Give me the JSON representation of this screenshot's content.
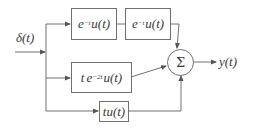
{
  "diagram": {
    "type": "block-diagram",
    "input": {
      "label": "δ(t)"
    },
    "output": {
      "label": "y(t)"
    },
    "blocks": [
      {
        "id": "h1",
        "base": "e",
        "exponent": "−t",
        "suffix": "u(t)"
      },
      {
        "id": "h2",
        "base": "e",
        "exponent": "−t",
        "suffix": "u(t)"
      },
      {
        "id": "h3",
        "prefix": "t",
        "base": "e",
        "exponent": "−2t",
        "suffix": "u(t)"
      },
      {
        "id": "h4",
        "prefix": "",
        "base": "",
        "exponent": "",
        "suffix": "tu(t)"
      }
    ],
    "summer": {
      "symbol": "Σ"
    },
    "connections": [
      "δ(t) → branch",
      "branch → h1",
      "h1 → h2",
      "h2 → Σ",
      "branch → h3",
      "h3 → Σ",
      "branch → h4",
      "h4 → Σ",
      "Σ → y(t)"
    ],
    "colors": {
      "line": "#707070",
      "text": "#3a3a3a",
      "background": "#ffffff"
    }
  }
}
